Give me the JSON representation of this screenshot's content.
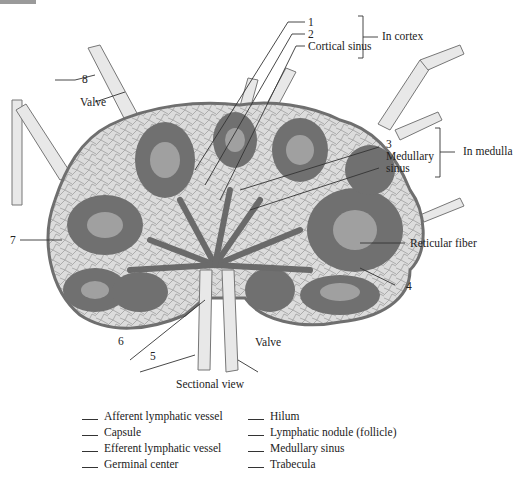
{
  "diagram": {
    "view_caption": "Sectional view",
    "labels": {
      "n1": "1",
      "n2": "2",
      "cortical_sinus": "Cortical sinus",
      "in_cortex": "In cortex",
      "n3": "3",
      "medullary_sinus_line1": "Medullary",
      "medullary_sinus_line2": "sinus",
      "in_medulla": "In medulla",
      "n4": "4",
      "n5": "5",
      "n6": "6",
      "n7": "7",
      "n8": "8",
      "valve_top": "Valve",
      "valve_bottom": "Valve",
      "reticular_fiber": "Reticular fiber"
    },
    "colors": {
      "capsule": "#8a8a8a",
      "sinus_fill": "#d9d9d9",
      "nodule": "#6e6e6e",
      "germinal_center": "#9c9c9c",
      "vessel": "#e6e6e6",
      "line": "#333333"
    }
  },
  "legend": {
    "left_column": [
      "Afferent lymphatic vessel",
      "Capsule",
      "Efferent lymphatic vessel",
      "Germinal center"
    ],
    "right_column": [
      "Hilum",
      "Lymphatic nodule (follicle)",
      "Medullary sinus",
      "Trabecula"
    ]
  }
}
